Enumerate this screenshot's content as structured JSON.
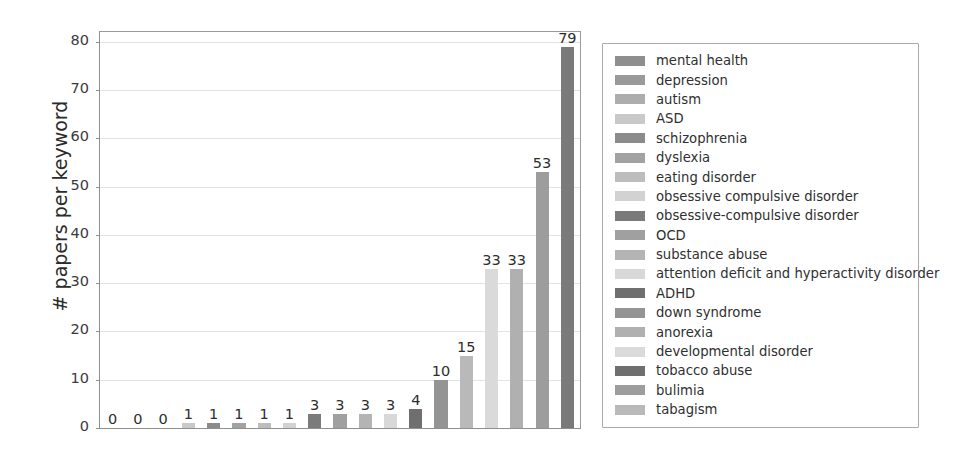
{
  "chart_data": {
    "type": "bar",
    "title": "",
    "xlabel": "",
    "ylabel": "# papers per keyword",
    "ylim": [
      0,
      82
    ],
    "yticks": [
      0,
      10,
      20,
      30,
      40,
      50,
      60,
      70,
      80
    ],
    "ytick_labels": [
      "0",
      "10",
      "20",
      "30",
      "40",
      "50",
      "60",
      "70",
      "80"
    ],
    "grid": "horizontal",
    "legend_position": "right-outside",
    "categories": [
      "mental health",
      "depression",
      "autism",
      "ASD",
      "schizophrenia",
      "dyslexia",
      "eating disorder",
      "obsessive compulsive disorder",
      "obsessive-compulsive disorder",
      "OCD",
      "substance abuse",
      "attention deficit and hyperactivity disorder",
      "ADHD",
      "down syndrome",
      "anorexia",
      "developmental disorder",
      "tobacco abuse",
      "bulimia",
      "tabagism"
    ],
    "values": [
      0,
      0,
      0,
      1,
      1,
      1,
      1,
      1,
      3,
      3,
      3,
      3,
      4,
      10,
      15,
      33,
      33,
      53,
      79
    ],
    "value_labels": [
      "0",
      "0",
      "0",
      "1",
      "1",
      "1",
      "1",
      "1",
      "3",
      "3",
      "3",
      "3",
      "4",
      "10",
      "15",
      "33",
      "33",
      "53",
      "79"
    ],
    "bar_colors": [
      "#8e8e8e",
      "#9a9a9a",
      "#adadad",
      "#c9c9c9",
      "#8b8b8b",
      "#a2a2a2",
      "#bdbdbd",
      "#d2d2d2",
      "#7b7b7b",
      "#a0a0a0",
      "#b4b4b4",
      "#d8d8d8",
      "#6f6f6f",
      "#949494",
      "#b9b9b9",
      "#dadada",
      "#b0b0b0",
      "#9d9d9d",
      "#7a7a7a"
    ]
  },
  "legend": {
    "items": [
      {
        "label": "mental health",
        "color": "#8e8e8e"
      },
      {
        "label": "depression",
        "color": "#9a9a9a"
      },
      {
        "label": "autism",
        "color": "#adadad"
      },
      {
        "label": "ASD",
        "color": "#c9c9c9"
      },
      {
        "label": "schizophrenia",
        "color": "#8b8b8b"
      },
      {
        "label": "dyslexia",
        "color": "#a2a2a2"
      },
      {
        "label": "eating disorder",
        "color": "#bdbdbd"
      },
      {
        "label": "obsessive compulsive disorder",
        "color": "#d2d2d2"
      },
      {
        "label": "obsessive-compulsive disorder",
        "color": "#7b7b7b"
      },
      {
        "label": "OCD",
        "color": "#a0a0a0"
      },
      {
        "label": "substance abuse",
        "color": "#b4b4b4"
      },
      {
        "label": "attention deficit and hyperactivity disorder",
        "color": "#d8d8d8"
      },
      {
        "label": "ADHD",
        "color": "#6f6f6f"
      },
      {
        "label": "down syndrome",
        "color": "#949494"
      },
      {
        "label": "anorexia",
        "color": "#b0b0b0"
      },
      {
        "label": "developmental disorder",
        "color": "#dadada"
      },
      {
        "label": "tobacco abuse",
        "color": "#6f6f6f"
      },
      {
        "label": "bulimia",
        "color": "#9d9d9d"
      },
      {
        "label": "tabagism",
        "color": "#b9b9b9"
      }
    ]
  }
}
